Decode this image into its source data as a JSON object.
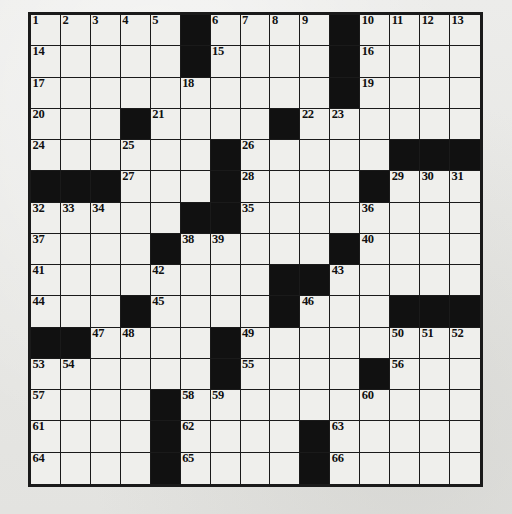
{
  "puzzle": {
    "title": "Crossword Puzzle Grid",
    "type": "crossword",
    "rows": 15,
    "cols": 15,
    "colors": {
      "paper": "#e9e9e6",
      "cell_fill": "#efefec",
      "block_fill": "#111111",
      "grid_line": "#1a1a1a",
      "number_text": "#101010"
    },
    "total_clue_numbers": 66,
    "block_count": 47,
    "grid": [
      [
        "1",
        "2",
        "3",
        "4",
        "5",
        "#",
        "6",
        "7",
        "8",
        "9",
        "#",
        "10",
        "11",
        "12",
        "13"
      ],
      [
        "14",
        "",
        "",
        "",
        "",
        "#",
        "15",
        "",
        "",
        "",
        "#",
        "16",
        "",
        "",
        ""
      ],
      [
        "17",
        "",
        "",
        "",
        "",
        "18",
        "",
        "",
        "",
        "",
        "#",
        "19",
        "",
        "",
        ""
      ],
      [
        "20",
        "",
        "",
        "#",
        "21",
        "",
        "",
        "",
        "#",
        "22",
        "23",
        "",
        "",
        "",
        ""
      ],
      [
        "24",
        "",
        "",
        "25",
        "",
        "",
        "#",
        "26",
        "",
        "",
        "",
        "",
        "#",
        "#",
        "#"
      ],
      [
        "#",
        "#",
        "#",
        "27",
        "",
        "",
        "#",
        "28",
        "",
        "",
        "",
        "#",
        "29",
        "30",
        "31"
      ],
      [
        "32",
        "33",
        "34",
        "",
        "",
        "#",
        "#",
        "35",
        "",
        "",
        "",
        "36",
        "",
        "",
        ""
      ],
      [
        "37",
        "",
        "",
        "",
        "#",
        "38",
        "39",
        "",
        "",
        "",
        "#",
        "40",
        "",
        "",
        ""
      ],
      [
        "41",
        "",
        "",
        "",
        "42",
        "",
        "",
        "",
        "#",
        "#",
        "43",
        "",
        "",
        "",
        ""
      ],
      [
        "44",
        "",
        "",
        "#",
        "45",
        "",
        "",
        "",
        "#",
        "46",
        "",
        "",
        "#",
        "#",
        "#"
      ],
      [
        "#",
        "#",
        "47",
        "48",
        "",
        "",
        "#",
        "49",
        "",
        "",
        "",
        "",
        "50",
        "51",
        "52"
      ],
      [
        "53",
        "54",
        "",
        "",
        "",
        "",
        "#",
        "55",
        "",
        "",
        "",
        "#",
        "56",
        "",
        ""
      ],
      [
        "57",
        "",
        "",
        "",
        "#",
        "58",
        "59",
        "",
        "",
        "",
        "",
        "60",
        "",
        "",
        ""
      ],
      [
        "61",
        "",
        "",
        "",
        "#",
        "62",
        "",
        "",
        "",
        "#",
        "63",
        "",
        "",
        "",
        ""
      ],
      [
        "64",
        "",
        "",
        "",
        "#",
        "65",
        "",
        "",
        "",
        "#",
        "66",
        "",
        "",
        "",
        ""
      ]
    ],
    "blocks": [
      [
        0,
        5
      ],
      [
        0,
        10
      ],
      [
        1,
        5
      ],
      [
        1,
        10
      ],
      [
        2,
        10
      ],
      [
        3,
        3
      ],
      [
        3,
        8
      ],
      [
        4,
        6
      ],
      [
        4,
        12
      ],
      [
        4,
        13
      ],
      [
        4,
        14
      ],
      [
        5,
        0
      ],
      [
        5,
        1
      ],
      [
        5,
        2
      ],
      [
        5,
        6
      ],
      [
        5,
        11
      ],
      [
        6,
        5
      ],
      [
        6,
        6
      ],
      [
        7,
        4
      ],
      [
        7,
        10
      ],
      [
        8,
        8
      ],
      [
        8,
        9
      ],
      [
        9,
        3
      ],
      [
        9,
        8
      ],
      [
        9,
        12
      ],
      [
        9,
        13
      ],
      [
        9,
        14
      ],
      [
        10,
        0
      ],
      [
        10,
        1
      ],
      [
        10,
        6
      ],
      [
        11,
        6
      ],
      [
        11,
        11
      ],
      [
        12,
        4
      ],
      [
        13,
        4
      ],
      [
        13,
        9
      ],
      [
        14,
        4
      ],
      [
        14,
        9
      ]
    ]
  }
}
